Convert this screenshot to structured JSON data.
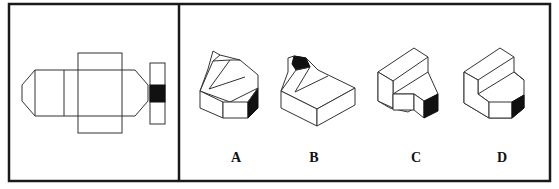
{
  "puzzle": {
    "question_panel": {
      "description": "unfolded net of a 3D solid with one shaded face"
    },
    "options": [
      {
        "label": "A",
        "x": 236
      },
      {
        "label": "B",
        "x": 314
      },
      {
        "label": "C",
        "x": 416
      },
      {
        "label": "D",
        "x": 502
      }
    ]
  },
  "colors": {
    "frame": "#1a1a1a",
    "line": "#333333",
    "shaded_face": "#111111",
    "background": "#ffffff"
  }
}
